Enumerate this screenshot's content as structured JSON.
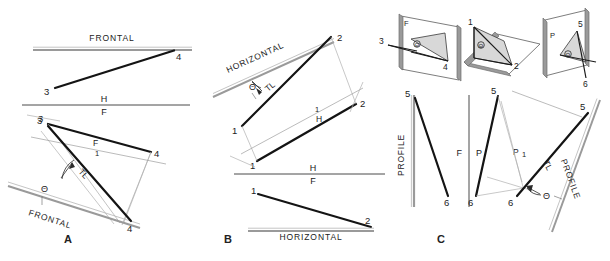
{
  "figure": {
    "panels": [
      {
        "key": "A",
        "label": "A",
        "reference_plane": "FRONTAL",
        "fold_line": {
          "upper": "H",
          "lower": "F"
        },
        "points": [
          "3",
          "4"
        ],
        "annotations": [
          "TL",
          "Θ",
          "F",
          "FRONTAL"
        ]
      },
      {
        "key": "B",
        "label": "B",
        "reference_plane": "HORIZONTAL",
        "fold_line": {
          "upper": "H",
          "lower": "F"
        },
        "points": [
          "1",
          "2"
        ],
        "annotations": [
          "TL",
          "Θ",
          "H",
          "HORIZONTAL"
        ]
      },
      {
        "key": "C",
        "label": "C",
        "reference_plane": "PROFILE",
        "fold_line": {
          "left": "F",
          "right": "P"
        },
        "points": [
          "5",
          "6"
        ],
        "annotations": [
          "TL",
          "Θ",
          "P",
          "PROFILE"
        ]
      }
    ]
  },
  "panelA": {
    "label": "A",
    "frontal_top": "FRONTAL",
    "frontal_bottom": "FRONTAL",
    "fold_h": "H",
    "fold_f": "F",
    "p3_top": "3",
    "p4_top": "4",
    "p3_front": "3",
    "p4_front": "4",
    "p3_aux": "3",
    "p4_aux": "4",
    "f_label": "F",
    "tick_label": "1",
    "tl": "TL",
    "theta": "Θ",
    "aux_tick": "1"
  },
  "panelB": {
    "label": "B",
    "horizontal_aux": "HORIZONTAL",
    "horizontal_front": "HORIZONTAL",
    "fold_h": "H",
    "fold_f": "F",
    "p1_aux": "1",
    "p2_aux": "2",
    "p1_top": "1",
    "p2_top": "2",
    "p1_front": "1",
    "p2_front": "2",
    "h_label": "H",
    "tick_label": "1",
    "tl": "TL",
    "theta": "Θ"
  },
  "panelC": {
    "label": "C",
    "profile_left": "PROFILE",
    "profile_right": "PROFILE",
    "fold_f": "F",
    "fold_p": "P",
    "p5_front": "5",
    "p6_front": "6",
    "p5_profile": "5",
    "p6_profile": "6",
    "p5_aux": "5",
    "p6_aux": "6",
    "p_label": "P",
    "tick_label": "1",
    "tl": "TL",
    "theta": "Θ",
    "pictorials": [
      {
        "name": "frontal-pictorial",
        "plane_label": "F",
        "pt_a": "3",
        "pt_b": "4",
        "theta": "Θ"
      },
      {
        "name": "horizontal-pictorial",
        "plane_label": "",
        "pt_a": "1",
        "pt_b": "2",
        "theta": "Θ"
      },
      {
        "name": "profile-pictorial",
        "plane_label": "P",
        "pt_a": "5",
        "pt_b": "6",
        "theta": "Θ"
      }
    ]
  },
  "colors": {
    "ink": "#1a1a1a",
    "thin": "#8a8a8a",
    "plane_fill": "#d8d8d8",
    "plane_edge": "#6e6e6e",
    "reference_band": "#9a9a9a"
  }
}
